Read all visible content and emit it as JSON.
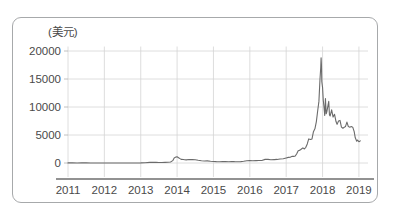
{
  "chart_data": {
    "type": "line",
    "title": "",
    "subtitle": "",
    "xlabel": "",
    "ylabel": "(美元)",
    "ylabel_text": "(美元)",
    "xlim": [
      2011,
      2019.25
    ],
    "ylim": [
      0,
      21500
    ],
    "grid": true,
    "legend": "none",
    "yticks": [
      0,
      5000,
      10000,
      15000,
      20000
    ],
    "ytick_labels": [
      "0",
      "5000",
      "10000",
      "15000",
      "20000"
    ],
    "xticks": [
      2011,
      2012,
      2013,
      2014,
      2015,
      2016,
      2017,
      2018,
      2019
    ],
    "xtick_labels": [
      "2011",
      "2012",
      "2013",
      "2014",
      "2015",
      "2016",
      "2017",
      "2018",
      "2019"
    ],
    "series": [
      {
        "name": "price",
        "color": "#6b6b6b",
        "x": [
          2011.0,
          2011.12,
          2011.25,
          2011.38,
          2011.5,
          2011.62,
          2011.75,
          2011.88,
          2012.0,
          2012.12,
          2012.25,
          2012.38,
          2012.5,
          2012.62,
          2012.75,
          2012.88,
          2013.0,
          2013.12,
          2013.25,
          2013.33,
          2013.42,
          2013.5,
          2013.58,
          2013.67,
          2013.75,
          2013.82,
          2013.88,
          2013.92,
          2013.96,
          2014.0,
          2014.04,
          2014.08,
          2014.12,
          2014.17,
          2014.21,
          2014.25,
          2014.33,
          2014.42,
          2014.5,
          2014.58,
          2014.67,
          2014.75,
          2014.83,
          2014.92,
          2015.0,
          2015.08,
          2015.17,
          2015.25,
          2015.33,
          2015.42,
          2015.5,
          2015.58,
          2015.67,
          2015.75,
          2015.83,
          2015.92,
          2016.0,
          2016.08,
          2016.17,
          2016.25,
          2016.33,
          2016.42,
          2016.5,
          2016.58,
          2016.67,
          2016.75,
          2016.83,
          2016.92,
          2017.0,
          2017.06,
          2017.12,
          2017.17,
          2017.21,
          2017.25,
          2017.29,
          2017.33,
          2017.38,
          2017.42,
          2017.46,
          2017.5,
          2017.54,
          2017.58,
          2017.62,
          2017.67,
          2017.71,
          2017.75,
          2017.79,
          2017.83,
          2017.87,
          2017.9,
          2017.93,
          2017.95,
          2017.96,
          2017.97,
          2017.98,
          2018.0,
          2018.02,
          2018.04,
          2018.06,
          2018.08,
          2018.1,
          2018.12,
          2018.15,
          2018.17,
          2018.19,
          2018.21,
          2018.25,
          2018.29,
          2018.33,
          2018.37,
          2018.4,
          2018.44,
          2018.48,
          2018.52,
          2018.56,
          2018.6,
          2018.63,
          2018.67,
          2018.71,
          2018.75,
          2018.79,
          2018.83,
          2018.87,
          2018.9,
          2018.94,
          2018.96,
          2019.0,
          2019.04
        ],
        "y": [
          20,
          15,
          8,
          22,
          14,
          10,
          5,
          4,
          6,
          5,
          5,
          6,
          8,
          11,
          12,
          13,
          20,
          45,
          110,
          135,
          120,
          100,
          95,
          110,
          125,
          190,
          420,
          900,
          1050,
          1120,
          950,
          780,
          640,
          620,
          580,
          550,
          620,
          600,
          580,
          480,
          390,
          360,
          380,
          320,
          280,
          250,
          235,
          240,
          245,
          235,
          270,
          240,
          235,
          245,
          300,
          400,
          430,
          400,
          420,
          440,
          455,
          650,
          650,
          575,
          610,
          640,
          720,
          760,
          900,
          1000,
          1050,
          1200,
          1180,
          1250,
          1650,
          2200,
          2300,
          2500,
          2700,
          2500,
          2800,
          3400,
          4300,
          4200,
          4300,
          5600,
          6100,
          7400,
          9500,
          11000,
          15000,
          17000,
          18800,
          17500,
          14500,
          13500,
          11200,
          10000,
          8500,
          11500,
          8800,
          9200,
          10300,
          11000,
          8600,
          8400,
          9500,
          8200,
          8700,
          7400,
          6900,
          7500,
          7600,
          6400,
          6200,
          6400,
          6500,
          7300,
          6500,
          6400,
          6500,
          6400,
          5600,
          4500,
          3900,
          4100,
          3800,
          3950
        ]
      }
    ],
    "annotations": {
      "peak_value": 18800,
      "peak_year": 2017.96,
      "end_value": 3950
    }
  },
  "axis": {
    "unit_label": "(美元)"
  }
}
